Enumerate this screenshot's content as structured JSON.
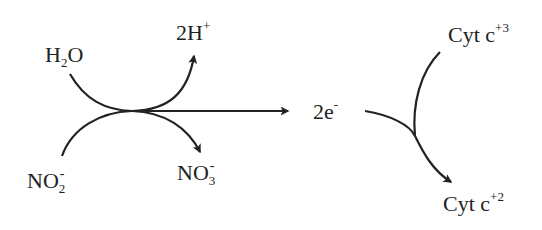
{
  "diagram": {
    "type": "reaction-scheme",
    "colors": {
      "line": "#222222",
      "text": "#222222",
      "background": "#ffffff"
    },
    "left_reaction": {
      "reactant_top": {
        "base": "H",
        "sub": "2",
        "tail": "O"
      },
      "reactant_bottom": {
        "base": "NO",
        "sub": "2",
        "sup": "-"
      },
      "product_top": {
        "base": "2H",
        "sup": "+"
      },
      "product_bottom": {
        "base": "NO",
        "sub": "3",
        "sup": "-"
      }
    },
    "electrons": {
      "base": "2e",
      "sup": "-"
    },
    "right_reaction": {
      "reactant": {
        "base": "Cyt c",
        "sup": "+3"
      },
      "product": {
        "base": "Cyt c",
        "sup": "+2"
      }
    },
    "arrows": [
      {
        "from": "H2O",
        "to": "2H+",
        "style": "curved"
      },
      {
        "from": "NO2-",
        "to": "NO3-",
        "style": "curved"
      },
      {
        "from": "junction",
        "to": "2e-",
        "style": "straight"
      },
      {
        "from": "2e-",
        "to": "Cyt c+2",
        "style": "curved"
      },
      {
        "from": "Cyt c+3",
        "to": "Cyt c+2",
        "style": "curved"
      }
    ]
  }
}
